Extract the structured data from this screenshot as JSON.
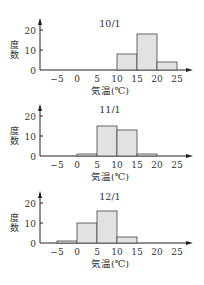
{
  "chart_data": [
    {
      "type": "bar",
      "title": "10/1",
      "xlabel": "気温(℃)",
      "ylabel": "度数",
      "bin_edges": [
        -5,
        0,
        5,
        10,
        15,
        20,
        25
      ],
      "categories": [
        "-5–0",
        "0–5",
        "5–10",
        "10–15",
        "15–20",
        "20–25"
      ],
      "values": [
        0,
        0,
        0,
        8,
        18,
        4
      ],
      "ylim": [
        0,
        25
      ],
      "yticks": [
        0,
        10,
        20
      ],
      "xticks": [
        "−5",
        "0",
        "5",
        "10",
        "15",
        "20",
        "25"
      ],
      "grid": false
    },
    {
      "type": "bar",
      "title": "11/1",
      "xlabel": "気温(℃)",
      "ylabel": "度数",
      "bin_edges": [
        -5,
        0,
        5,
        10,
        15,
        20,
        25
      ],
      "categories": [
        "-5–0",
        "0–5",
        "5–10",
        "10–15",
        "15–20",
        "20–25"
      ],
      "values": [
        0,
        1,
        15,
        13,
        1,
        0
      ],
      "ylim": [
        0,
        25
      ],
      "yticks": [
        0,
        10,
        20
      ],
      "xticks": [
        "−5",
        "0",
        "5",
        "10",
        "15",
        "20",
        "25"
      ],
      "grid": false
    },
    {
      "type": "bar",
      "title": "12/1",
      "xlabel": "気温(℃)",
      "ylabel": "度数",
      "bin_edges": [
        -5,
        0,
        5,
        10,
        15,
        20,
        25
      ],
      "categories": [
        "-5–0",
        "0–5",
        "5–10",
        "10–15",
        "15–20",
        "20–25"
      ],
      "values": [
        1,
        10,
        16,
        3,
        0,
        0
      ],
      "ylim": [
        0,
        25
      ],
      "yticks": [
        0,
        10,
        20
      ],
      "xticks": [
        "−5",
        "0",
        "5",
        "10",
        "15",
        "20",
        "25"
      ],
      "grid": false
    }
  ],
  "style": {
    "bar_fill": "#e2e2e2",
    "bar_stroke": "#444444",
    "axis": "#222222"
  }
}
